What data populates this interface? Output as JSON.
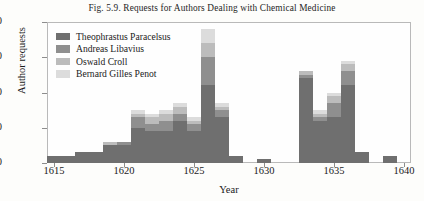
{
  "figure": {
    "title": "Fig. 5.9. Requests for Authors Dealing with Chemical Medicine"
  },
  "chart_data": {
    "type": "bar",
    "stacked": true,
    "title": "Fig. 5.9. Requests for Authors Dealing with Chemical Medicine",
    "xlabel": "Year",
    "ylabel": "Author requests",
    "xlim": [
      1614.5,
      1640.5
    ],
    "ylim": [
      0,
      40
    ],
    "grid": false,
    "legend_position": "top-left",
    "yticks": [
      0,
      10,
      20,
      30,
      40
    ],
    "ytick_labels": [
      "0",
      "10",
      "20",
      "30",
      "40"
    ],
    "xticks": [
      1615,
      1620,
      1625,
      1630,
      1635,
      1640
    ],
    "xtick_labels": [
      "1615",
      "1620",
      "1625",
      "1630",
      "1635",
      "1640"
    ],
    "categories": [
      1615,
      1616,
      1617,
      1618,
      1619,
      1620,
      1621,
      1622,
      1623,
      1624,
      1625,
      1626,
      1627,
      1628,
      1629,
      1630,
      1631,
      1632,
      1633,
      1634,
      1635,
      1636,
      1637,
      1638,
      1639,
      1640
    ],
    "series": [
      {
        "name": "Theophrastus Paracelsus",
        "color": "#6f6f6f",
        "values": [
          2,
          2,
          3,
          3,
          5,
          5,
          10,
          9,
          9,
          12,
          9,
          22,
          13,
          2,
          0,
          1,
          0,
          0,
          24,
          12,
          13,
          22,
          3,
          0,
          2,
          0
        ]
      },
      {
        "name": "Andreas Libavius",
        "color": "#8f8f8f",
        "values": [
          0,
          0,
          0,
          0,
          0,
          1,
          3,
          2,
          3,
          2,
          2,
          8,
          2,
          0,
          0,
          0,
          0,
          0,
          1,
          1,
          4,
          4,
          0,
          0,
          0,
          0
        ]
      },
      {
        "name": "Oswald Croll",
        "color": "#bcbcbc",
        "values": [
          0,
          0,
          0,
          0,
          1,
          0,
          1,
          2,
          2,
          2,
          1,
          4,
          1,
          0,
          0,
          0,
          0,
          0,
          1,
          1,
          2,
          2,
          0,
          0,
          0,
          0
        ]
      },
      {
        "name": "Bernard Gilles Penot",
        "color": "#dcdcdc",
        "values": [
          0,
          0,
          0,
          0,
          0,
          0,
          1,
          1,
          1,
          1,
          1,
          4,
          1,
          0,
          0,
          0,
          0,
          0,
          0,
          1,
          1,
          1,
          0,
          0,
          0,
          0
        ]
      }
    ],
    "totals": [
      2,
      2,
      3,
      3,
      6,
      6,
      15,
      14,
      15,
      17,
      13,
      38,
      17,
      2,
      0,
      1,
      0,
      0,
      26,
      15,
      20,
      29,
      3,
      0,
      2,
      0
    ]
  },
  "legend": {
    "items": [
      {
        "label": "Theophrastus Paracelsus"
      },
      {
        "label": "Andreas Libavius"
      },
      {
        "label": "Oswald Croll"
      },
      {
        "label": "Bernard Gilles Penot"
      }
    ]
  }
}
